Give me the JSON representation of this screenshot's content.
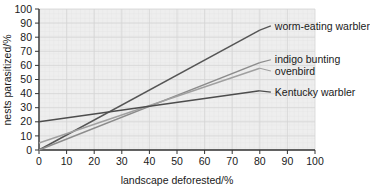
{
  "chart_data": {
    "type": "line",
    "title": "",
    "xlabel": "landscape deforested/%",
    "ylabel": "nests parasitized/%",
    "xlim": [
      0,
      100
    ],
    "ylim": [
      0,
      100
    ],
    "xticks": [
      0,
      10,
      20,
      30,
      40,
      50,
      60,
      70,
      80,
      90,
      100
    ],
    "yticks": [
      0,
      10,
      20,
      30,
      40,
      50,
      60,
      70,
      80,
      90,
      100
    ],
    "grid": true,
    "legend_position": "right-inline-labels",
    "series": [
      {
        "name": "worm-eating warbler",
        "color": "#555555",
        "x": [
          0,
          80
        ],
        "y": [
          0,
          85
        ],
        "label_x": 84,
        "label_y": 88
      },
      {
        "name": "indigo bunting",
        "color": "#8c8c8c",
        "x": [
          0,
          80
        ],
        "y": [
          0,
          62
        ],
        "label_x": 84,
        "label_y": 64
      },
      {
        "name": "ovenbird",
        "color": "#a0a0a0",
        "x": [
          0,
          80
        ],
        "y": [
          5,
          58
        ],
        "label_x": 84,
        "label_y": 56
      },
      {
        "name": "Kentucky warbler",
        "color": "#4d4d4d",
        "x": [
          0,
          80
        ],
        "y": [
          20,
          42
        ],
        "label_x": 84,
        "label_y": 41
      }
    ]
  },
  "axis": {
    "x_tick_labels": [
      "0",
      "10",
      "20",
      "30",
      "40",
      "50",
      "60",
      "70",
      "80",
      "90",
      "100"
    ],
    "y_tick_labels": [
      "0",
      "10",
      "20",
      "30",
      "40",
      "50",
      "60",
      "70",
      "80",
      "90",
      "100"
    ],
    "x_title": "landscape deforested/%",
    "y_title": "nests parasitized/%"
  },
  "legend": {
    "items": [
      "worm-eating warbler",
      "indigo bunting",
      "ovenbird",
      "Kentucky warbler"
    ]
  },
  "colors": {
    "plot_background": "#eeeeee",
    "grid_minor": "#e2e2e2",
    "grid_major": "#d2d2d2",
    "axis": "#333333",
    "page_background": "#ffffff"
  }
}
